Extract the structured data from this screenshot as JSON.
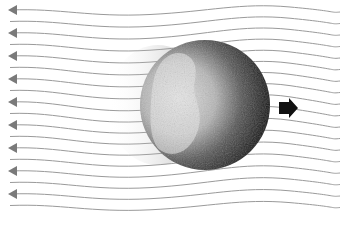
{
  "diagram": {
    "flow_lines": {
      "count": 18,
      "spacing_px": 11.5,
      "start_y": 10,
      "color": "#9a9a9a",
      "arrowhead_color": "#7a7a7a",
      "arrowhead_every": 2,
      "direction": "left"
    },
    "sphere": {
      "cx": 205,
      "cy": 105,
      "r": 65,
      "light_color": "#d8d8d8",
      "dark_color": "#111111"
    },
    "motion_arrow": {
      "direction": "right",
      "color": "#111111"
    },
    "colors": {
      "background": "#ffffff"
    }
  }
}
